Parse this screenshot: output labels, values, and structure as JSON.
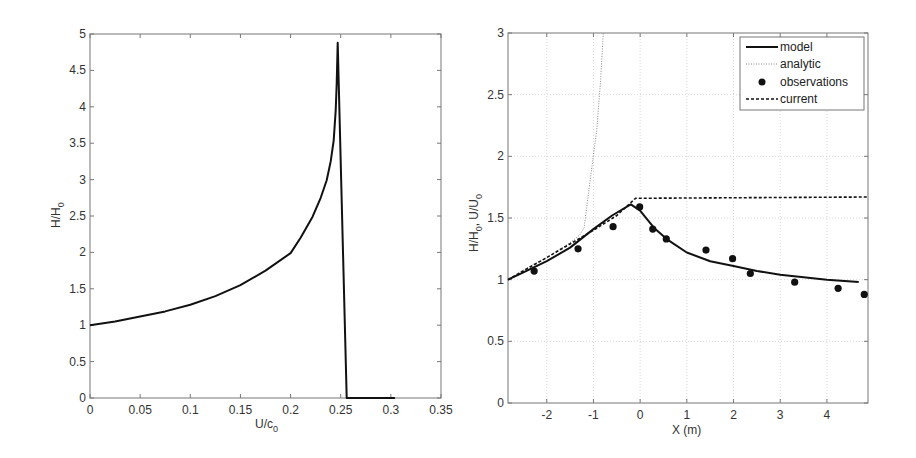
{
  "chart_data": [
    {
      "type": "line",
      "title": "",
      "xlabel": "U/c0",
      "xlabel_main": "U/c",
      "xlabel_sub": "0",
      "ylabel": "H/H0",
      "ylabel_main": "H/H",
      "ylabel_sub": "0",
      "xlim": [
        0,
        0.35
      ],
      "ylim": [
        0,
        5
      ],
      "grid": false,
      "xticks": [
        0,
        0.05,
        0.1,
        0.15,
        0.2,
        0.25,
        0.3,
        0.35
      ],
      "xtick_labels": [
        "0",
        "0.05",
        "0.1",
        "0.15",
        "0.2",
        "0.25",
        "0.3",
        "0.35"
      ],
      "yticks": [
        0,
        0.5,
        1,
        1.5,
        2,
        2.5,
        3,
        3.5,
        4,
        4.5,
        5
      ],
      "ytick_labels": [
        "0",
        "0.5",
        "1",
        "1.5",
        "2",
        "2.5",
        "3",
        "3.5",
        "4",
        "4.5",
        "5"
      ],
      "series": [
        {
          "name": "H/H0",
          "style": "solid",
          "color": "#111111",
          "x": [
            0,
            0.025,
            0.05,
            0.075,
            0.1,
            0.125,
            0.15,
            0.175,
            0.2,
            0.21,
            0.222,
            0.23,
            0.236,
            0.24,
            0.243,
            0.245,
            0.246,
            0.247,
            0.256,
            0.304
          ],
          "y": [
            1.0,
            1.05,
            1.12,
            1.19,
            1.28,
            1.4,
            1.55,
            1.75,
            1.99,
            2.2,
            2.49,
            2.75,
            2.99,
            3.25,
            3.54,
            3.95,
            4.32,
            4.88,
            0,
            0
          ]
        }
      ]
    },
    {
      "type": "line",
      "title": "",
      "xlabel": "X (m)",
      "ylabel": "H/H0, U/U0",
      "ylabel_main": "H/H",
      "ylabel_mid": ", U/U",
      "ylabel_sub": "0",
      "xlim": [
        -2.83,
        4.88
      ],
      "ylim": [
        0,
        3
      ],
      "grid": true,
      "legend_position": "upper right",
      "xticks": [
        -2,
        -1,
        0,
        1,
        2,
        3,
        4
      ],
      "xtick_labels": [
        "-2",
        "-1",
        "0",
        "1",
        "2",
        "3",
        "4"
      ],
      "yticks": [
        0,
        0.5,
        1,
        1.5,
        2,
        2.5,
        3
      ],
      "ytick_labels": [
        "0",
        "0.5",
        "1",
        "1.5",
        "2",
        "2.5",
        "3"
      ],
      "series": [
        {
          "name": "model",
          "style": "solid",
          "color": "#111111",
          "x": [
            -2.83,
            -2.5,
            -2.0,
            -1.5,
            -1.0,
            -0.6,
            -0.2,
            0.0,
            0.3,
            0.6,
            1.0,
            1.5,
            2.0,
            2.5,
            3.0,
            3.5,
            4.0,
            4.68
          ],
          "y": [
            1.0,
            1.06,
            1.15,
            1.26,
            1.41,
            1.52,
            1.61,
            1.56,
            1.42,
            1.32,
            1.22,
            1.15,
            1.11,
            1.07,
            1.04,
            1.02,
            1.0,
            0.98
          ]
        },
        {
          "name": "analytic",
          "style": "dotted",
          "color": "#888888",
          "x": [
            -2.83,
            -2.5,
            -2.0,
            -1.5,
            -1.3,
            -1.2,
            -1.07,
            -0.93,
            -0.85,
            -0.79
          ],
          "y": [
            1.0,
            1.08,
            1.18,
            1.3,
            1.36,
            1.42,
            1.81,
            2.21,
            2.6,
            3.0
          ]
        },
        {
          "name": "observations",
          "style": "marker",
          "color": "#111111",
          "x": [
            -2.27,
            -1.33,
            -0.58,
            -0.01,
            0.27,
            0.56,
            1.41,
            1.98,
            2.36,
            3.31,
            4.24,
            4.8
          ],
          "y": [
            1.07,
            1.25,
            1.43,
            1.59,
            1.41,
            1.33,
            1.24,
            1.17,
            1.05,
            0.98,
            0.93,
            0.88
          ]
        },
        {
          "name": "current",
          "style": "dashed",
          "color": "#111111",
          "x": [
            -2.83,
            -2.0,
            -1.0,
            -0.5,
            -0.1,
            4.88
          ],
          "y": [
            1.0,
            1.18,
            1.4,
            1.52,
            1.66,
            1.67
          ]
        }
      ],
      "legend": [
        "model",
        "analytic",
        "observations",
        "current"
      ]
    }
  ]
}
